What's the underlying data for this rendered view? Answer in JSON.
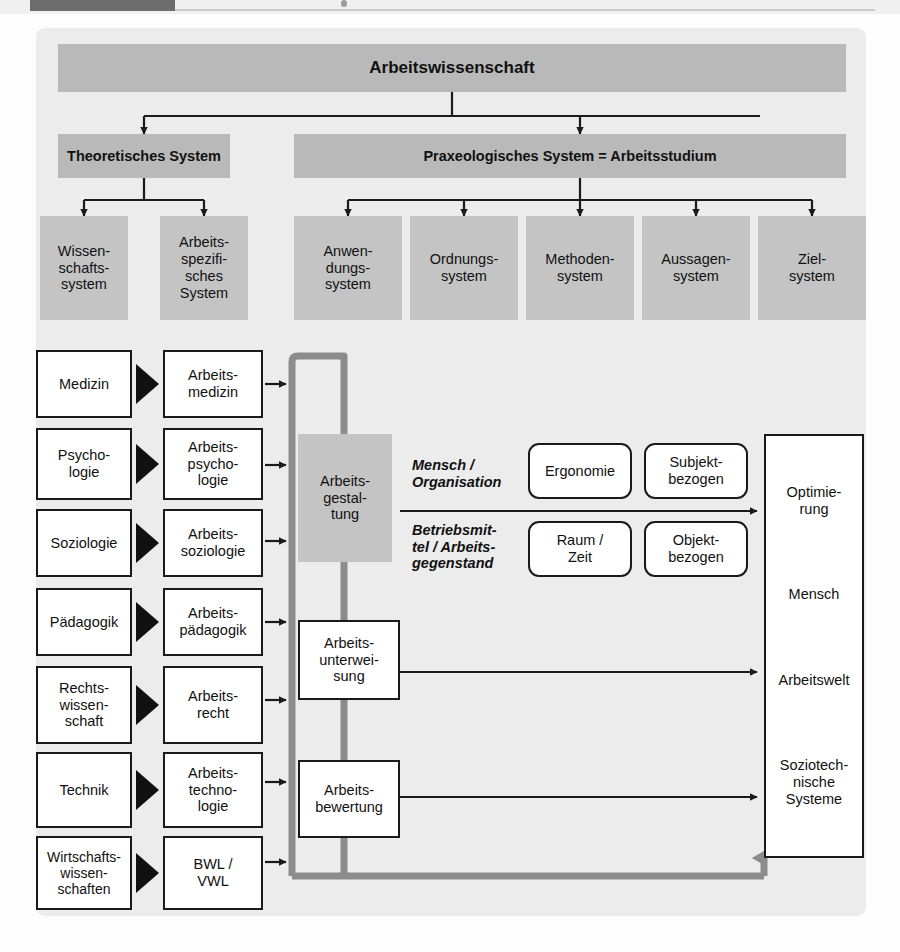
{
  "diagram": {
    "root": {
      "label": "Arbeitswissenschaft"
    },
    "level2": [
      {
        "label": "Theoretisches System"
      },
      {
        "label": "Praxeologisches System = Arbeitsstudium"
      }
    ],
    "theoretical_children": [
      {
        "lines": [
          "Wissen-",
          "schafts-",
          "system"
        ]
      },
      {
        "lines": [
          "Arbeits-",
          "spezifi-",
          "sches",
          "System"
        ]
      }
    ],
    "praxeological_children": [
      {
        "lines": [
          "Anwen-",
          "dungs-",
          "system"
        ]
      },
      {
        "lines": [
          "Ordnungs-",
          "system"
        ]
      },
      {
        "lines": [
          "Methoden-",
          "system"
        ]
      },
      {
        "lines": [
          "Aussagen-",
          "system"
        ]
      },
      {
        "lines": [
          "Ziel-",
          "system"
        ]
      }
    ],
    "disciplines": [
      {
        "source": [
          "Medizin"
        ],
        "applied": [
          "Arbeits-",
          "medizin"
        ]
      },
      {
        "source": [
          "Psycho-",
          "logie"
        ],
        "applied": [
          "Arbeits-",
          "psycho-",
          "logie"
        ]
      },
      {
        "source": [
          "Soziologie"
        ],
        "applied": [
          "Arbeits-",
          "soziologie"
        ]
      },
      {
        "source": [
          "Pädagogik"
        ],
        "applied": [
          "Arbeits-",
          "pädagogik"
        ]
      },
      {
        "source": [
          "Rechts-",
          "wissen-",
          "schaft"
        ],
        "applied": [
          "Arbeits-",
          "recht"
        ]
      },
      {
        "source": [
          "Technik"
        ],
        "applied": [
          "Arbeits-",
          "techno-",
          "logie"
        ]
      },
      {
        "source": [
          "Wirtschafts-",
          "wissen-",
          "schaften"
        ],
        "applied": [
          "BWL /",
          "VWL"
        ]
      }
    ],
    "core": {
      "design": [
        "Arbeits-",
        "gestal-",
        "tung"
      ],
      "instruction": [
        "Arbeits-",
        "unterwei-",
        "sung"
      ],
      "evaluation": [
        "Arbeits-",
        "bewertung"
      ]
    },
    "aspects": [
      {
        "label": [
          "Mensch /",
          "Organisation"
        ],
        "field": [
          "Ergonomie"
        ],
        "orientation": [
          "Subjekt-",
          "bezogen"
        ]
      },
      {
        "label": [
          "Betriebsmit-",
          "tel / Arbeits-",
          "gegenstand"
        ],
        "field": [
          "Raum /",
          "Zeit"
        ],
        "orientation": [
          "Objekt-",
          "bezogen"
        ]
      }
    ],
    "result": [
      {
        "lines": [
          "Optimie-",
          "rung"
        ]
      },
      {
        "lines": [
          "Mensch"
        ]
      },
      {
        "lines": [
          "Arbeitswelt"
        ]
      },
      {
        "lines": [
          "Soziotech-",
          "nische",
          "Systeme"
        ]
      }
    ],
    "colors": {
      "panel": "#ececec",
      "gray_bar": "#b9b9b9",
      "gray_soft": "#c4c4c4",
      "feedback_line": "#8c8c8c",
      "connector": "#1a1a1a"
    }
  }
}
